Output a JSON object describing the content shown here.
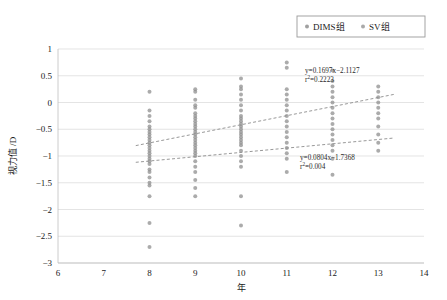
{
  "chart_data": {
    "type": "scatter",
    "title": "",
    "xlabel": "年",
    "ylabel": "视力值 /D",
    "xlim": [
      6,
      14
    ],
    "ylim": [
      -3,
      1
    ],
    "xticks": [
      "6",
      "7",
      "8",
      "9",
      "10",
      "11",
      "12",
      "13",
      "14"
    ],
    "yticks": [
      "1",
      "0.5",
      "0",
      "-0.5",
      "-1",
      "-1.5",
      "-2",
      "-2.5",
      "-3"
    ],
    "grid": "horizontal",
    "legend_position": "top-right",
    "legend": [
      {
        "label": "DIMS组",
        "color": "#8f8f8f",
        "marker": "circle"
      },
      {
        "label": "SV组",
        "color": "#9a9a9a",
        "marker": "circle"
      }
    ],
    "annotations": [
      {
        "name": "dims-fit-equation",
        "equation": "y=0.1697x−2.1127",
        "r2_prefix": "r",
        "r2_sup": "2",
        "r2_value": "=0.2223",
        "x_px": 305,
        "y_px": 73
      },
      {
        "name": "sv-fit-equation",
        "equation": "y=0.0804x−1.7368",
        "r2_prefix": "r",
        "r2_sup": "2",
        "r2_value": "=0.004",
        "x_px": 300,
        "y_px": 160
      }
    ],
    "trendlines": [
      {
        "name": "DIMS组",
        "slope": 0.1697,
        "intercept": -2.1127,
        "r2": 0.2223,
        "x_start": 7.7,
        "x_end": 13.35
      },
      {
        "name": "SV组",
        "slope": 0.0804,
        "intercept": -1.7368,
        "r2": 0.004,
        "x_start": 7.7,
        "x_end": 13.35
      }
    ],
    "series": [
      {
        "name": "DIMS组",
        "color": "#8f8f8f",
        "points": [
          [
            8,
            0.2
          ],
          [
            8,
            -0.15
          ],
          [
            8,
            -0.25
          ],
          [
            8,
            -0.35
          ],
          [
            8,
            -0.45
          ],
          [
            8,
            -0.5
          ],
          [
            8,
            -0.55
          ],
          [
            8,
            -0.6
          ],
          [
            8,
            -0.65
          ],
          [
            8,
            -0.7
          ],
          [
            8,
            -0.75
          ],
          [
            8,
            -0.8
          ],
          [
            8,
            -0.85
          ],
          [
            8,
            -0.9
          ],
          [
            8,
            -0.95
          ],
          [
            8,
            -1.0
          ],
          [
            8,
            -1.05
          ],
          [
            8,
            -1.1
          ],
          [
            8,
            -1.15
          ],
          [
            8,
            -1.25
          ],
          [
            8,
            -1.3
          ],
          [
            8,
            -1.4
          ],
          [
            8,
            -1.5
          ],
          [
            8,
            -1.55
          ],
          [
            8,
            -1.75
          ],
          [
            8,
            -2.25
          ],
          [
            8,
            -2.7
          ],
          [
            9,
            0.25
          ],
          [
            9,
            0.2
          ],
          [
            9,
            0.05
          ],
          [
            9,
            -0.05
          ],
          [
            9,
            -0.1
          ],
          [
            9,
            -0.2
          ],
          [
            9,
            -0.25
          ],
          [
            9,
            -0.3
          ],
          [
            9,
            -0.35
          ],
          [
            9,
            -0.4
          ],
          [
            9,
            -0.45
          ],
          [
            9,
            -0.5
          ],
          [
            9,
            -0.55
          ],
          [
            9,
            -0.6
          ],
          [
            9,
            -0.65
          ],
          [
            9,
            -0.7
          ],
          [
            9,
            -0.75
          ],
          [
            9,
            -0.8
          ],
          [
            9,
            -0.85
          ],
          [
            9,
            -0.9
          ],
          [
            9,
            -0.95
          ],
          [
            9,
            -1.0
          ],
          [
            9,
            -1.1
          ],
          [
            9,
            -1.2
          ],
          [
            9,
            -1.3
          ],
          [
            9,
            -1.45
          ],
          [
            9,
            -1.6
          ],
          [
            9,
            -1.75
          ],
          [
            10,
            0.45
          ],
          [
            10,
            0.3
          ],
          [
            10,
            0.25
          ],
          [
            10,
            0.15
          ],
          [
            10,
            0.05
          ],
          [
            10,
            -0.05
          ],
          [
            10,
            -0.15
          ],
          [
            10,
            -0.25
          ],
          [
            10,
            -0.3
          ],
          [
            10,
            -0.35
          ],
          [
            10,
            -0.4
          ],
          [
            10,
            -0.45
          ],
          [
            10,
            -0.5
          ],
          [
            10,
            -0.55
          ],
          [
            10,
            -0.6
          ],
          [
            10,
            -0.65
          ],
          [
            10,
            -0.7
          ],
          [
            10,
            -0.75
          ],
          [
            10,
            -0.8
          ],
          [
            10,
            -0.9
          ],
          [
            10,
            -1.0
          ],
          [
            10,
            -1.1
          ],
          [
            10,
            -1.2
          ],
          [
            10,
            -1.75
          ],
          [
            10,
            -2.3
          ],
          [
            11,
            0.75
          ],
          [
            11,
            0.65
          ],
          [
            11,
            0.25
          ],
          [
            11,
            0.15
          ],
          [
            11,
            0.05
          ],
          [
            11,
            -0.05
          ],
          [
            11,
            -0.15
          ],
          [
            11,
            -0.25
          ],
          [
            11,
            -0.35
          ],
          [
            11,
            -0.45
          ],
          [
            11,
            -0.55
          ],
          [
            11,
            -0.65
          ],
          [
            11,
            -0.75
          ],
          [
            11,
            -0.85
          ],
          [
            11,
            -0.95
          ],
          [
            11,
            -1.05
          ],
          [
            11,
            -1.3
          ],
          [
            12,
            0.6
          ],
          [
            12,
            0.4
          ],
          [
            12,
            0.3
          ],
          [
            12,
            0.2
          ],
          [
            12,
            0.1
          ],
          [
            12,
            0.0
          ],
          [
            12,
            -0.1
          ],
          [
            12,
            -0.2
          ],
          [
            12,
            -0.3
          ],
          [
            12,
            -0.4
          ],
          [
            12,
            -0.5
          ],
          [
            12,
            -0.6
          ],
          [
            12,
            -0.7
          ],
          [
            12,
            -0.8
          ],
          [
            12,
            -0.9
          ],
          [
            12,
            -1.05
          ],
          [
            12,
            -1.35
          ],
          [
            13,
            0.3
          ],
          [
            13,
            0.2
          ],
          [
            13,
            0.1
          ],
          [
            13,
            0.0
          ],
          [
            13,
            -0.1
          ],
          [
            13,
            -0.2
          ],
          [
            13,
            -0.3
          ],
          [
            13,
            -0.45
          ],
          [
            13,
            -0.6
          ],
          [
            13,
            -0.75
          ],
          [
            13,
            -0.9
          ]
        ]
      }
    ],
    "marker_size_px": 2.0,
    "marker_opacity": 0.75
  }
}
